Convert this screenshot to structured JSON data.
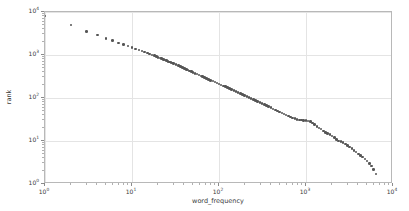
{
  "chart_data": {
    "type": "scatter",
    "title": "",
    "xlabel": "word_frequency",
    "ylabel": "rank",
    "xscale": "log",
    "yscale": "log",
    "xlim": [
      1,
      10000
    ],
    "ylim": [
      1,
      10000
    ],
    "grid": true,
    "legend": null,
    "marker": {
      "shape": "circle",
      "color": "#555555",
      "size": 2.6
    },
    "xticks": [
      1,
      10,
      100,
      1000,
      10000
    ],
    "xticklabels": [
      "10",
      "10",
      "10",
      "10",
      "10"
    ],
    "xtickexponents": [
      "0",
      "1",
      "2",
      "3",
      "4"
    ],
    "yticks": [
      1,
      10,
      100,
      1000,
      10000
    ],
    "yticklabels": [
      "10",
      "10",
      "10",
      "10",
      "10"
    ],
    "ytickexponents": [
      "0",
      "1",
      "2",
      "3",
      "4"
    ],
    "points": [
      [
        1,
        8000
      ],
      [
        2,
        5000
      ],
      [
        3,
        3500
      ],
      [
        4,
        2900
      ],
      [
        5,
        2400
      ],
      [
        6,
        2150
      ],
      [
        7,
        1900
      ],
      [
        8,
        1750
      ],
      [
        9,
        1620
      ],
      [
        10,
        1500
      ],
      [
        11,
        1390
      ],
      [
        12,
        1310
      ],
      [
        13,
        1240
      ],
      [
        14,
        1180
      ],
      [
        15,
        1120
      ],
      [
        16,
        1060
      ],
      [
        17,
        1010
      ],
      [
        18,
        965
      ],
      [
        19,
        925
      ],
      [
        20,
        885
      ],
      [
        21,
        850
      ],
      [
        22,
        818
      ],
      [
        23,
        788
      ],
      [
        24,
        760
      ],
      [
        25,
        735
      ],
      [
        26,
        710
      ],
      [
        27,
        688
      ],
      [
        28,
        666
      ],
      [
        29,
        646
      ],
      [
        30,
        627
      ],
      [
        32,
        592
      ],
      [
        34,
        561
      ],
      [
        36,
        533
      ],
      [
        38,
        508
      ],
      [
        40,
        485
      ],
      [
        42,
        464
      ],
      [
        44,
        445
      ],
      [
        46,
        427
      ],
      [
        48,
        411
      ],
      [
        50,
        396
      ],
      [
        53,
        376
      ],
      [
        56,
        358
      ],
      [
        59,
        341
      ],
      [
        62,
        326
      ],
      [
        65,
        312
      ],
      [
        68,
        300
      ],
      [
        72,
        285
      ],
      [
        76,
        271
      ],
      [
        80,
        259
      ],
      [
        85,
        246
      ],
      [
        90,
        234
      ],
      [
        95,
        223
      ],
      [
        100,
        213
      ],
      [
        106,
        202
      ],
      [
        112,
        192
      ],
      [
        118,
        183
      ],
      [
        125,
        174
      ],
      [
        132,
        166
      ],
      [
        140,
        157
      ],
      [
        148,
        149
      ],
      [
        157,
        141
      ],
      [
        166,
        134
      ],
      [
        176,
        127
      ],
      [
        186,
        121
      ],
      [
        197,
        115
      ],
      [
        209,
        109
      ],
      [
        221,
        103
      ],
      [
        234,
        98
      ],
      [
        248,
        93
      ],
      [
        263,
        88
      ],
      [
        279,
        83
      ],
      [
        295,
        79
      ],
      [
        313,
        75
      ],
      [
        331,
        71
      ],
      [
        351,
        67
      ],
      [
        372,
        63
      ],
      [
        394,
        60
      ],
      [
        418,
        56
      ],
      [
        443,
        53
      ],
      [
        469,
        50
      ],
      [
        497,
        47
      ],
      [
        527,
        45
      ],
      [
        558,
        42
      ],
      [
        591,
        40
      ],
      [
        627,
        38
      ],
      [
        664,
        36
      ],
      [
        704,
        34
      ],
      [
        746,
        33
      ],
      [
        790,
        32
      ],
      [
        837,
        31
      ],
      [
        887,
        31
      ],
      [
        940,
        30
      ],
      [
        996,
        30
      ],
      [
        1055,
        29
      ],
      [
        1118,
        28
      ],
      [
        1185,
        26
      ],
      [
        1256,
        24
      ],
      [
        1331,
        22
      ],
      [
        1410,
        20
      ],
      [
        1494,
        19
      ],
      [
        1583,
        17
      ],
      [
        1677,
        16
      ],
      [
        1777,
        15
      ],
      [
        1883,
        14
      ],
      [
        1996,
        13
      ],
      [
        2115,
        12
      ],
      [
        2241,
        11
      ],
      [
        2374,
        10
      ],
      [
        2516,
        9.6
      ],
      [
        2666,
        9.2
      ],
      [
        2825,
        8.5
      ],
      [
        2993,
        7.8
      ],
      [
        3172,
        7.2
      ],
      [
        3361,
        6.6
      ],
      [
        3561,
        6.0
      ],
      [
        3773,
        5.5
      ],
      [
        3998,
        5.0
      ],
      [
        4236,
        4.6
      ],
      [
        4489,
        4.2
      ],
      [
        4757,
        3.8
      ],
      [
        5040,
        3.4
      ],
      [
        5341,
        3.0
      ],
      [
        5659,
        2.6
      ],
      [
        5996,
        2.2
      ],
      [
        6353,
        1.7
      ],
      [
        6731,
        1.0
      ]
    ]
  }
}
